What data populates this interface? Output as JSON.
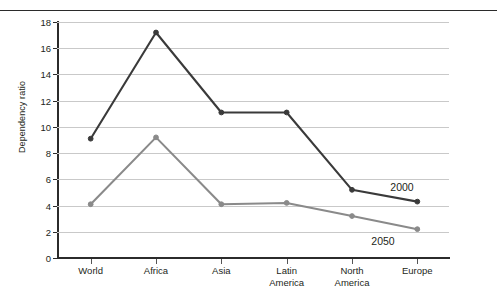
{
  "figure": {
    "has_top_rule": true,
    "background": "#ffffff"
  },
  "chart_data": {
    "type": "line",
    "title": "",
    "xlabel": "",
    "ylabel": "Dependency ratio",
    "categories": [
      "World",
      "Africa",
      "Asia",
      "Latin America",
      "North America",
      "Europe"
    ],
    "category_lines": [
      [
        "World"
      ],
      [
        "Africa"
      ],
      [
        "Asia"
      ],
      [
        "Latin",
        "America"
      ],
      [
        "North",
        "America"
      ],
      [
        "Europe"
      ]
    ],
    "ylim": [
      0,
      18
    ],
    "yticks": [
      0,
      2,
      4,
      6,
      8,
      10,
      12,
      14,
      16,
      18
    ],
    "ytick_labels": [
      "0",
      "2",
      "4",
      "6",
      "8",
      "10",
      "12",
      "14",
      "16",
      "18"
    ],
    "grid": true,
    "grid_color": "#c9c9c9",
    "legend_position": "inline-end-of-line",
    "series": [
      {
        "name": "2000",
        "color": "#3a3a3a",
        "values": [
          9.1,
          17.2,
          11.1,
          11.1,
          5.2,
          4.3
        ],
        "label": "2000"
      },
      {
        "name": "2050",
        "color": "#8a8a8a",
        "values": [
          4.1,
          9.2,
          4.1,
          4.2,
          3.2,
          2.2
        ],
        "label": "2050"
      }
    ]
  }
}
